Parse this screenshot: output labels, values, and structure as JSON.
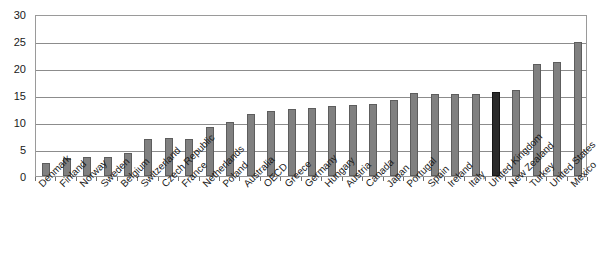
{
  "chart_data": {
    "type": "bar",
    "title": "",
    "subtitle": "",
    "xlabel": "",
    "ylabel": "",
    "ylim": [
      0,
      30
    ],
    "yticks": [
      0,
      5,
      10,
      15,
      20,
      25,
      30
    ],
    "grid": true,
    "legend": false,
    "legend_position": "none",
    "bar_color": "#808080",
    "highlight_color": "#2b2b2b",
    "highlighted_category": "United Kingdom",
    "categories": [
      "Denmark",
      "Finland",
      "Norway",
      "Sweden",
      "Belgium",
      "Switzerland",
      "Czech Republic",
      "France",
      "Netherlands",
      "Poland",
      "Australia",
      "OECD",
      "Greece",
      "Germany",
      "Hungary",
      "Austria",
      "Canada",
      "Japan",
      "Portugal",
      "Spain",
      "Ireland",
      "Italy",
      "United Kingdom",
      "New Zealand",
      "Turkey",
      "United States",
      "Mexico"
    ],
    "values": [
      2.5,
      3.4,
      3.6,
      3.6,
      4.2,
      6.8,
      7.0,
      6.9,
      9.1,
      10.0,
      11.5,
      12.0,
      12.4,
      12.6,
      12.9,
      13.2,
      13.4,
      14.1,
      15.3,
      15.2,
      15.2,
      15.2,
      15.6,
      16.0,
      20.7,
      21.1,
      24.8
    ]
  }
}
